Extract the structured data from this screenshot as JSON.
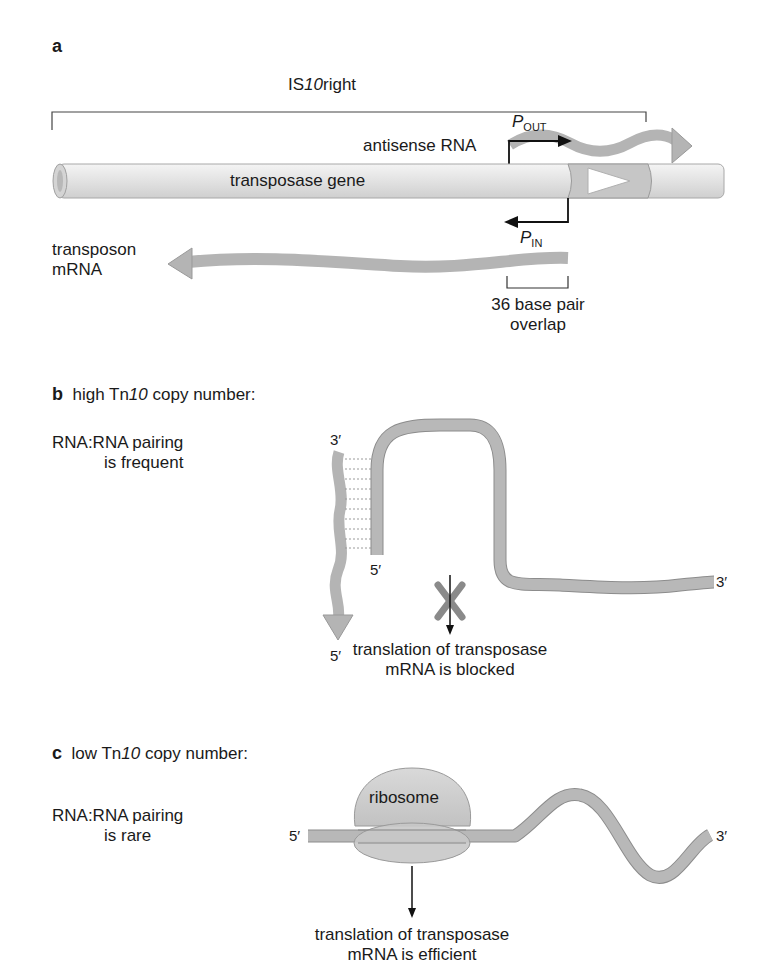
{
  "figure": {
    "panel_a": {
      "letter": "a",
      "element_label_prefix": "IS",
      "element_label_italic": "10",
      "element_label_suffix": "right",
      "antisense_rna_label": "antisense RNA",
      "promoter_out_letter": "P",
      "promoter_out_sub": "OUT",
      "promoter_in_letter": "P",
      "promoter_in_sub": "IN",
      "gene_label": "transposase gene",
      "mrna_label_line1": "transposon",
      "mrna_label_line2": "mRNA",
      "overlap_line1": "36 base pair",
      "overlap_line2": "overlap"
    },
    "panel_b": {
      "letter": "b",
      "title_prefix": "high Tn",
      "title_italic": "10",
      "title_suffix": " copy number:",
      "pairing_line1": "RNA:RNA pairing",
      "pairing_line2": "is frequent",
      "antisense_top_end": "3′",
      "antisense_bottom_end": "5′",
      "mrna_start_end": "5′",
      "mrna_finish_end": "3′",
      "outcome_line1": "translation of transposase",
      "outcome_line2": "mRNA is blocked"
    },
    "panel_c": {
      "letter": "c",
      "title_prefix": "low Tn",
      "title_italic": "10",
      "title_suffix": " copy number:",
      "pairing_line1": "RNA:RNA pairing",
      "pairing_line2": "is rare",
      "ribosome_label": "ribosome",
      "mrna_start_end": "5′",
      "mrna_finish_end": "3′",
      "outcome_line1": "translation of transposase",
      "outcome_line2": "mRNA is efficient"
    },
    "colors": {
      "rna_fill": "#b4b4b4",
      "rna_stroke": "#8c8c8c",
      "gene_fill": "#e6e6e6",
      "block_x": "#8a8a8a",
      "text": "#1a1a1a"
    }
  }
}
